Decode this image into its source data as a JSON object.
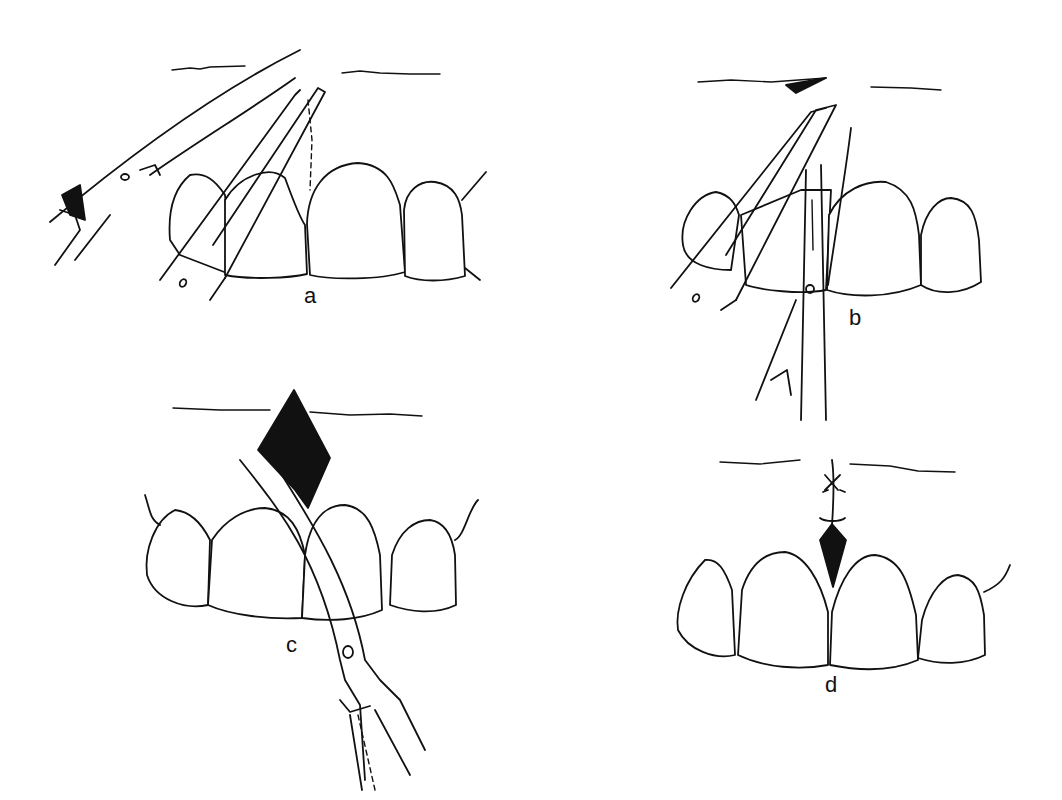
{
  "figure": {
    "panels": [
      {
        "id": "a",
        "label": "a",
        "step": "Frenum grasped with hemostat; curved scissors positioned"
      },
      {
        "id": "b",
        "label": "b",
        "step": "Frenum clamped with hemostat; incision with scissors along hemostat"
      },
      {
        "id": "c",
        "label": "c",
        "step": "Diamond-shaped excision; remaining fibers cut with curved scissors"
      },
      {
        "id": "d",
        "label": "d",
        "step": "Wound closed with sutures"
      }
    ]
  }
}
